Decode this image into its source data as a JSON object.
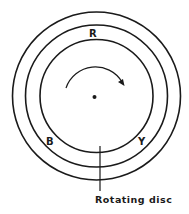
{
  "diagram": {
    "center": {
      "x": 96.5,
      "y": 96
    },
    "rings": [
      {
        "name": "outer-ring",
        "r": 84
      },
      {
        "name": "middle-ring",
        "r": 71
      },
      {
        "name": "inner-ring",
        "r": 56
      }
    ],
    "labels": {
      "r": "R",
      "b": "B",
      "y": "Y",
      "caption": "Rotating disc"
    },
    "stroke_color": "#1a1a1a",
    "rotation_direction": "clockwise"
  }
}
